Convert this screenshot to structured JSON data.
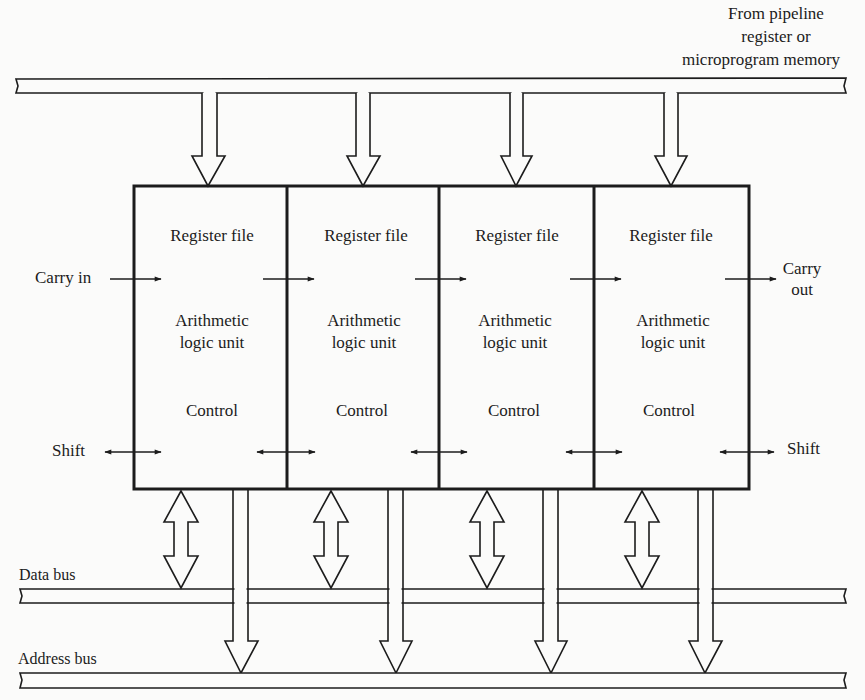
{
  "diagram": {
    "source_label": [
      "From pipeline",
      "register or",
      "microprogram memory"
    ],
    "slices": [
      {
        "register": "Register file",
        "alu": [
          "Arithmetic",
          "logic unit"
        ],
        "control": "Control"
      },
      {
        "register": "Register file",
        "alu": [
          "Arithmetic",
          "logic unit"
        ],
        "control": "Control"
      },
      {
        "register": "Register file",
        "alu": [
          "Arithmetic",
          "logic unit"
        ],
        "control": "Control"
      },
      {
        "register": "Register file",
        "alu": [
          "Arithmetic",
          "logic unit"
        ],
        "control": "Control"
      }
    ],
    "carry_in": "Carry in",
    "carry_out": [
      "Carry",
      "out"
    ],
    "shift_left": "Shift",
    "shift_right": "Shift",
    "data_bus": "Data bus",
    "address_bus": "Address  bus",
    "colors": {
      "line": "#1c1c1c",
      "background": "#fbfbfa"
    }
  }
}
